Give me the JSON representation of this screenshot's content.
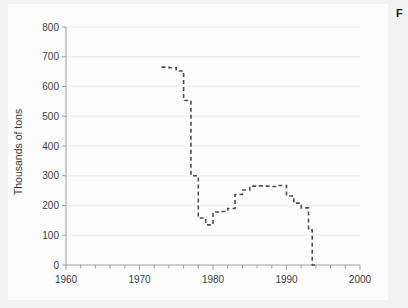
{
  "figure": {
    "caption_partial": "F"
  },
  "chart_data": {
    "type": "line",
    "title": "",
    "subtitle": "",
    "xlabel": "",
    "ylabel": "Thousands of tons",
    "xlim": [
      1960,
      2000
    ],
    "ylim": [
      0,
      800
    ],
    "x_tick_labels": [
      "1960",
      "1970",
      "1980",
      "1990",
      "2000"
    ],
    "x_major_ticks": [
      1960,
      1970,
      1980,
      1990,
      2000
    ],
    "x_minor_tick_step": 2,
    "y_tick_labels": [
      "0",
      "100",
      "200",
      "300",
      "400",
      "500",
      "600",
      "700",
      "800"
    ],
    "y_major_ticks": [
      0,
      100,
      200,
      300,
      400,
      500,
      600,
      700,
      800
    ],
    "grid": "horizontal",
    "legend": [],
    "line_style": "dashed-step",
    "series": [
      {
        "name": "Production",
        "x": [
          1973,
          1974,
          1975,
          1976,
          1977,
          1978,
          1979,
          1980,
          1981,
          1982,
          1983,
          1984,
          1985,
          1986,
          1987,
          1988,
          1989,
          1990,
          1991,
          1992,
          1993
        ],
        "values": [
          665,
          663,
          652,
          553,
          300,
          158,
          135,
          178,
          180,
          190,
          237,
          252,
          265,
          266,
          265,
          264,
          267,
          232,
          208,
          192,
          118
        ]
      }
    ],
    "end_point": {
      "x": 1993.5,
      "value": 0
    },
    "annotations": []
  }
}
